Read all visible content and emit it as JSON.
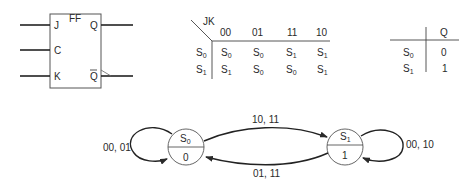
{
  "flip_flop": {
    "title": "FF",
    "inputs": [
      "J",
      "C",
      "K"
    ],
    "outputs": [
      "Q",
      "Q"
    ]
  },
  "excitation_table": {
    "corner_label": "JK",
    "columns": [
      "00",
      "01",
      "11",
      "10"
    ],
    "rows": [
      {
        "state": "S",
        "state_sub": "0",
        "next": [
          {
            "s": "S",
            "sub": "0"
          },
          {
            "s": "S",
            "sub": "0"
          },
          {
            "s": "S",
            "sub": "1"
          },
          {
            "s": "S",
            "sub": "1"
          }
        ]
      },
      {
        "state": "S",
        "state_sub": "1",
        "next": [
          {
            "s": "S",
            "sub": "1"
          },
          {
            "s": "S",
            "sub": "0"
          },
          {
            "s": "S",
            "sub": "0"
          },
          {
            "s": "S",
            "sub": "1"
          }
        ]
      }
    ]
  },
  "output_table": {
    "header": "Q",
    "rows": [
      {
        "state": "S",
        "state_sub": "0",
        "value": "0"
      },
      {
        "state": "S",
        "state_sub": "1",
        "value": "1"
      }
    ]
  },
  "state_diagram": {
    "states": [
      {
        "name": "S",
        "sub": "0",
        "output": "0"
      },
      {
        "name": "S",
        "sub": "1",
        "output": "1"
      }
    ],
    "transitions": {
      "s0_self": "00, 01",
      "s0_to_s1": "10, 11",
      "s1_to_s0": "01, 11",
      "s1_self": "00, 10"
    }
  }
}
